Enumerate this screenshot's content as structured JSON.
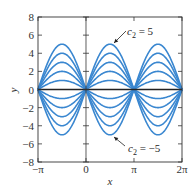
{
  "chart_data": {
    "type": "line",
    "title": "",
    "function": "y = c2 sin x",
    "xlabel": "x",
    "ylabel": "y",
    "xlim": [
      -3.14159,
      6.28319
    ],
    "ylim": [
      -8,
      8
    ],
    "grid": false,
    "legend": "none",
    "x_ticks": [
      {
        "value": -3.14159,
        "label": "−π"
      },
      {
        "value": 0,
        "label": "0"
      },
      {
        "value": 3.14159,
        "label": "π"
      },
      {
        "value": 6.28319,
        "label": "2π"
      }
    ],
    "y_ticks": [
      {
        "value": -8,
        "label": "−8"
      },
      {
        "value": -6,
        "label": "−6"
      },
      {
        "value": -4,
        "label": "−4"
      },
      {
        "value": -2,
        "label": "−2"
      },
      {
        "value": 0,
        "label": "0"
      },
      {
        "value": 2,
        "label": "2"
      },
      {
        "value": 4,
        "label": "4"
      },
      {
        "value": 6,
        "label": "6"
      },
      {
        "value": 8,
        "label": "8"
      }
    ],
    "series": [
      {
        "name": "c2 = 5",
        "c2": 5
      },
      {
        "name": "c2 = 4",
        "c2": 4
      },
      {
        "name": "c2 = 3",
        "c2": 3
      },
      {
        "name": "c2 = 2",
        "c2": 2
      },
      {
        "name": "c2 = 1",
        "c2": 1
      },
      {
        "name": "c2 = -1",
        "c2": -1
      },
      {
        "name": "c2 = -2",
        "c2": -2
      },
      {
        "name": "c2 = -3",
        "c2": -3
      },
      {
        "name": "c2 = -4",
        "c2": -4
      },
      {
        "name": "c2 = -5",
        "c2": -5
      }
    ],
    "annotations": [
      {
        "text_var": "c",
        "text_sub": "2",
        "text_rest": " = 5",
        "points_to_c2": 5
      },
      {
        "text_var": "c",
        "text_sub": "2",
        "text_rest": " = −5",
        "points_to_c2": -5
      }
    ],
    "colors": {
      "curve": "#3a87d0",
      "axis": "#333333",
      "zero_line": "#222222"
    }
  }
}
